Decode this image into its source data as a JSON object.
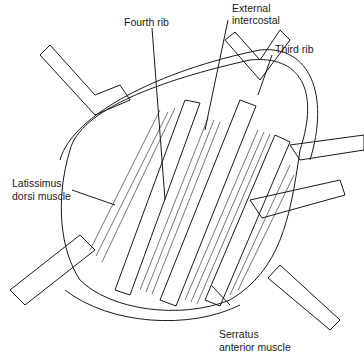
{
  "figure": {
    "type": "anatomical illustration"
  },
  "labels": {
    "fourth_rib": "Fourth rib",
    "external_intercostal_line1": "External",
    "external_intercostal_line2": "intercostal",
    "third_rib": "Third rib",
    "latissimus_line1": "Latissimus",
    "latissimus_line2": "dorsi muscle",
    "serratus_line1": "Serratus",
    "serratus_line2": "anterior muscle"
  },
  "colors": {
    "ink": "#1a1a1a",
    "background": "#ffffff"
  }
}
